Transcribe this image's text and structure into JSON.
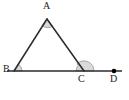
{
  "figure": {
    "kind": "geometry-diagram",
    "background_color": "#ffffff",
    "stroke_color": "#2b2b2b",
    "arc_fill_color": "#d9d9d9",
    "arc_stroke_color": "#808080",
    "point_marker_color": "#000000",
    "labels": [
      {
        "id": "A",
        "text": "A",
        "x": 44,
        "y": 2
      },
      {
        "id": "B",
        "text": "B",
        "x": 4,
        "y": 65
      },
      {
        "id": "C",
        "text": "C",
        "x": 79,
        "y": 74
      },
      {
        "id": "D",
        "text": "D",
        "x": 110,
        "y": 74
      }
    ],
    "points": [
      {
        "id": "A",
        "x": 47,
        "y": 19
      },
      {
        "id": "B",
        "x": 14,
        "y": 71
      },
      {
        "id": "C",
        "x": 84,
        "y": 71
      },
      {
        "id": "D",
        "x": 114,
        "y": 71
      }
    ],
    "segments": [
      {
        "id": "AB",
        "x1": 47,
        "y1": 19,
        "x2": 14,
        "y2": 71
      },
      {
        "id": "AC",
        "x1": 47,
        "y1": 19,
        "x2": 84,
        "y2": 71
      },
      {
        "id": "BD",
        "x1": 7,
        "y1": 71,
        "x2": 122,
        "y2": 71
      }
    ],
    "angle_marks": [
      {
        "id": "angle-A",
        "vertex": "A",
        "radius": 8,
        "label": "apex angle at A"
      },
      {
        "id": "angle-B",
        "vertex": "B",
        "radius": 8,
        "label": "interior angle at B"
      },
      {
        "id": "angle-C-interior",
        "vertex": "C",
        "radius": 8,
        "label": "interior angle at C"
      },
      {
        "id": "angle-C-exterior",
        "vertex": "C",
        "radius": 10,
        "label": "exterior angle at C toward D"
      }
    ],
    "dot_markers": [
      {
        "id": "D",
        "x": 114,
        "y": 71,
        "r": 2.2
      }
    ]
  }
}
